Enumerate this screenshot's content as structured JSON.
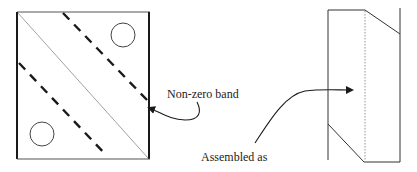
{
  "diagram": {
    "labels": {
      "band": "Non-zero band",
      "assembled": "Assembled as"
    },
    "colors": {
      "stroke": "#1a1a1a",
      "light_stroke": "#8a8a8a",
      "background": "#ffffff"
    },
    "left_figure": {
      "shape": "square matrix",
      "elements": [
        "outer square",
        "main diagonal (thin)",
        "upper dashed band boundary",
        "lower dashed band boundary",
        "upper-right circle",
        "lower-left circle"
      ]
    },
    "right_figure": {
      "shape": "assembled band storage",
      "elements": [
        "left vertical",
        "right vertical",
        "dotted center column",
        "top slanted edge",
        "bottom slanted edge"
      ]
    }
  }
}
